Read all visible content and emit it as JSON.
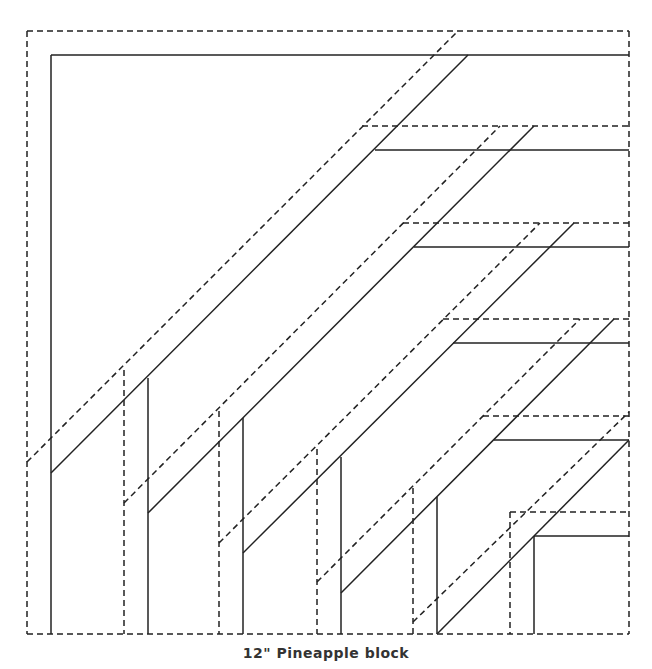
{
  "caption": "12\" Pineapple block",
  "diagram": {
    "type": "quilt-block-pattern",
    "name": "Pineapple block",
    "size": "12\"",
    "legend": {
      "solid": "finished seam line",
      "dashed": "cutting line (seam allowance)"
    },
    "outer_cut_square": {
      "x1": 27,
      "y1": 31,
      "x2": 629,
      "y2": 634
    },
    "solid_lines": [
      [
        51,
        55,
        629,
        55
      ],
      [
        51,
        55,
        51,
        634
      ],
      [
        375,
        150,
        629,
        150
      ],
      [
        414,
        247,
        629,
        247
      ],
      [
        453,
        343,
        629,
        343
      ],
      [
        494,
        440,
        629,
        440
      ],
      [
        534,
        536,
        629,
        536
      ],
      [
        534,
        536,
        534,
        634
      ],
      [
        51,
        473,
        468,
        55
      ],
      [
        148,
        513,
        534,
        126
      ],
      [
        243,
        553,
        574,
        223
      ],
      [
        341,
        593,
        614,
        319
      ],
      [
        437,
        634,
        629,
        440
      ],
      [
        148,
        378,
        148,
        634
      ],
      [
        243,
        418,
        243,
        634
      ],
      [
        341,
        457,
        341,
        634
      ],
      [
        437,
        497,
        437,
        634
      ]
    ],
    "dashed_lines": [
      [
        27,
        31,
        629,
        31
      ],
      [
        27,
        31,
        27,
        634
      ],
      [
        629,
        31,
        629,
        634
      ],
      [
        27,
        634,
        629,
        634
      ],
      [
        362,
        126,
        629,
        126
      ],
      [
        403,
        223,
        629,
        223
      ],
      [
        443,
        319,
        629,
        319
      ],
      [
        483,
        416,
        629,
        416
      ],
      [
        510,
        512,
        629,
        512
      ],
      [
        510,
        512,
        510,
        634
      ],
      [
        27,
        462,
        458,
        31
      ],
      [
        124,
        503,
        500,
        126
      ],
      [
        219,
        543,
        540,
        223
      ],
      [
        317,
        582,
        580,
        319
      ],
      [
        413,
        622,
        629,
        412
      ],
      [
        124,
        370,
        124,
        634
      ],
      [
        219,
        411,
        219,
        634
      ],
      [
        317,
        449,
        317,
        634
      ],
      [
        413,
        488,
        413,
        634
      ]
    ]
  }
}
